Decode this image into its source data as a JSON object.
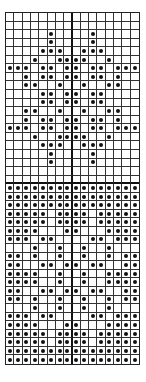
{
  "chart_data": {
    "type": "table",
    "title": "",
    "columns": 16,
    "rows": 41,
    "symbol": "dot",
    "heavy_lines": {
      "vertical_after_col": 7,
      "horizontal_after_row": 19
    },
    "dot_rows": [
      [],
      [],
      [
        5,
        10
      ],
      [
        5,
        10
      ],
      [
        4,
        5,
        6,
        9,
        10,
        11
      ],
      [
        3,
        6,
        7,
        8,
        9,
        12
      ],
      [
        0,
        1,
        2,
        4,
        5,
        7,
        8,
        10,
        11,
        13,
        14,
        15
      ],
      [
        2,
        4,
        5,
        7,
        8,
        10,
        11,
        13
      ],
      [
        2,
        3,
        6,
        9,
        12,
        13
      ],
      [
        4,
        5,
        7,
        8,
        10,
        11
      ],
      [
        4,
        5,
        7,
        8,
        10,
        11
      ],
      [
        2,
        3,
        6,
        9,
        12,
        13
      ],
      [
        2,
        4,
        5,
        7,
        8,
        10,
        11,
        13
      ],
      [
        0,
        1,
        2,
        4,
        5,
        7,
        8,
        10,
        11,
        13,
        14,
        15
      ],
      [
        3,
        6,
        7,
        8,
        9,
        12
      ],
      [
        4,
        5,
        6,
        9,
        10,
        11
      ],
      [
        5,
        10
      ],
      [
        5,
        10
      ],
      [],
      [],
      [
        0,
        1,
        2,
        3,
        4,
        5,
        6,
        7,
        8,
        9,
        10,
        11,
        12,
        13,
        14,
        15
      ],
      [
        0,
        1,
        2,
        3,
        4,
        5,
        6,
        7,
        8,
        9,
        10,
        11,
        12,
        13,
        14,
        15
      ],
      [
        0,
        1,
        2,
        3,
        4,
        5,
        6,
        7,
        8,
        9,
        10,
        11,
        12,
        13,
        14,
        15
      ],
      [
        0,
        1,
        2,
        3,
        4,
        6,
        7,
        8,
        9,
        11,
        12,
        13,
        14,
        15
      ],
      [
        0,
        1,
        2,
        3,
        4,
        6,
        7,
        8,
        9,
        11,
        12,
        13,
        14,
        15
      ],
      [
        0,
        1,
        2,
        3,
        7,
        8,
        12,
        13,
        14,
        15
      ],
      [
        0,
        1,
        2,
        4,
        5,
        10,
        11,
        13,
        14,
        15
      ],
      [
        3,
        6,
        9,
        12
      ],
      [
        0,
        1,
        3,
        6,
        9,
        12,
        14,
        15
      ],
      [
        0,
        1,
        4,
        5,
        7,
        8,
        10,
        11,
        14,
        15
      ],
      [
        0,
        1,
        2,
        3,
        6,
        9,
        12,
        13,
        14,
        15
      ],
      [
        0,
        1,
        2,
        3,
        6,
        9,
        12,
        13,
        14,
        15
      ],
      [
        0,
        1,
        4,
        5,
        7,
        8,
        10,
        11,
        14,
        15
      ],
      [
        0,
        1,
        3,
        6,
        9,
        12,
        14,
        15
      ],
      [
        3,
        6,
        9,
        12
      ],
      [
        0,
        1,
        2,
        4,
        5,
        10,
        11,
        13,
        14,
        15
      ],
      [
        0,
        1,
        2,
        3,
        7,
        8,
        12,
        13,
        14,
        15
      ],
      [
        0,
        1,
        2,
        3,
        4,
        6,
        7,
        8,
        9,
        11,
        12,
        13,
        14,
        15
      ],
      [
        0,
        1,
        2,
        3,
        4,
        6,
        7,
        8,
        9,
        11,
        12,
        13,
        14,
        15
      ],
      [
        0,
        1,
        2,
        3,
        4,
        5,
        6,
        7,
        8,
        9,
        10,
        11,
        12,
        13,
        14,
        15
      ],
      [
        0,
        1,
        2,
        3,
        4,
        5,
        6,
        7,
        8,
        9,
        10,
        11,
        12,
        13,
        14,
        15
      ]
    ]
  }
}
